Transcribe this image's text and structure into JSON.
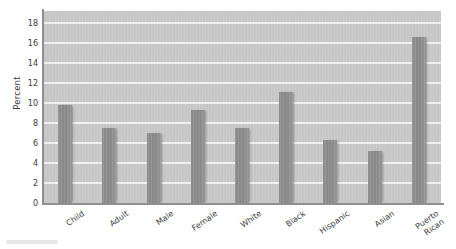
{
  "chart_data": {
    "type": "bar",
    "title": "",
    "xlabel": "",
    "ylabel": "Percent",
    "ylim": [
      0,
      19.2
    ],
    "yticks": [
      0,
      2,
      4,
      6,
      8,
      10,
      12,
      14,
      16,
      18
    ],
    "ytick_labels": [
      "0",
      "2",
      "4",
      "6",
      "8",
      "10",
      "12",
      "14",
      "16",
      "18"
    ],
    "grid": true,
    "legend": null,
    "categories": [
      "Child",
      "Adult",
      "Male",
      "Female",
      "White",
      "Black",
      "Hispanic",
      "Asian",
      "Puerto Rican"
    ],
    "category_lines": [
      [
        "Child"
      ],
      [
        "Adult"
      ],
      [
        "Male"
      ],
      [
        "Female"
      ],
      [
        "White"
      ],
      [
        "Black"
      ],
      [
        "Hispanic"
      ],
      [
        "Asian"
      ],
      [
        "Puerto",
        "Rican"
      ]
    ],
    "values": [
      9.8,
      7.5,
      7.0,
      9.3,
      7.5,
      11.1,
      6.3,
      5.2,
      16.6
    ],
    "bar_color": "#8a8a8a",
    "plot_background": "#c6c6c6",
    "gridline_color": "#f2f2f2",
    "text_color": "#3b3b3b"
  }
}
